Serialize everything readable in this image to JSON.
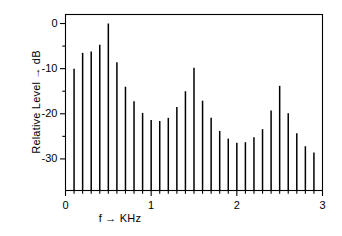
{
  "figure": {
    "background_color": "#ffffff",
    "line_color": "#000000"
  },
  "axes": {
    "x_label": "f → KHz",
    "y_label": "Relative Level  → dB",
    "x_ticks": [
      "0",
      "1",
      "2",
      "3"
    ],
    "y_ticks": [
      "0",
      "-10",
      "-20",
      "-30"
    ]
  },
  "chart_data": {
    "type": "bar",
    "title": "",
    "subtitle": "",
    "xlabel": "f → KHz",
    "ylabel": "Relative Level → dB",
    "xlim": [
      0,
      3
    ],
    "ylim": [
      -37,
      2
    ],
    "grid": false,
    "legend": null,
    "x_major_ticks": [
      0,
      1,
      2,
      3
    ],
    "x_minor_tick_step": 0.1,
    "y_major_ticks": [
      0,
      -10,
      -20,
      -30
    ],
    "y_minor_ticks": [
      -5,
      -15,
      -25
    ],
    "x_units": "kHz",
    "y_units": "dB",
    "baseline": -37,
    "x": [
      0.1,
      0.2,
      0.3,
      0.4,
      0.5,
      0.6,
      0.7,
      0.8,
      0.9,
      1.0,
      1.1,
      1.2,
      1.3,
      1.4,
      1.5,
      1.6,
      1.7,
      1.8,
      1.9,
      2.0,
      2.1,
      2.2,
      2.3,
      2.4,
      2.5,
      2.6,
      2.7,
      2.8,
      2.9
    ],
    "values": [
      -10.0,
      -6.5,
      -6.2,
      -4.7,
      0.0,
      -8.6,
      -14.0,
      -17.2,
      -19.8,
      -21.4,
      -21.6,
      -20.9,
      -18.5,
      -15.0,
      -9.8,
      -17.1,
      -20.9,
      -23.8,
      -25.5,
      -26.4,
      -26.3,
      -25.2,
      -23.4,
      -19.3,
      -13.8,
      -19.9,
      -24.3,
      -27.2,
      -28.6
    ],
    "categories": [
      "0.1",
      "0.2",
      "0.3",
      "0.4",
      "0.5",
      "0.6",
      "0.7",
      "0.8",
      "0.9",
      "1.0",
      "1.1",
      "1.2",
      "1.3",
      "1.4",
      "1.5",
      "1.6",
      "1.7",
      "1.8",
      "1.9",
      "2.0",
      "2.1",
      "2.2",
      "2.3",
      "2.4",
      "2.5",
      "2.6",
      "2.7",
      "2.8",
      "2.9"
    ],
    "series": [
      {
        "name": "spectrum",
        "values": [
          -10.0,
          -6.5,
          -6.2,
          -4.7,
          0.0,
          -8.6,
          -14.0,
          -17.2,
          -19.8,
          -21.4,
          -21.6,
          -20.9,
          -18.5,
          -15.0,
          -9.8,
          -17.1,
          -20.9,
          -23.8,
          -25.5,
          -26.4,
          -26.3,
          -25.2,
          -23.4,
          -19.3,
          -13.8,
          -19.9,
          -24.3,
          -27.2,
          -28.6
        ]
      }
    ],
    "annotations": []
  }
}
